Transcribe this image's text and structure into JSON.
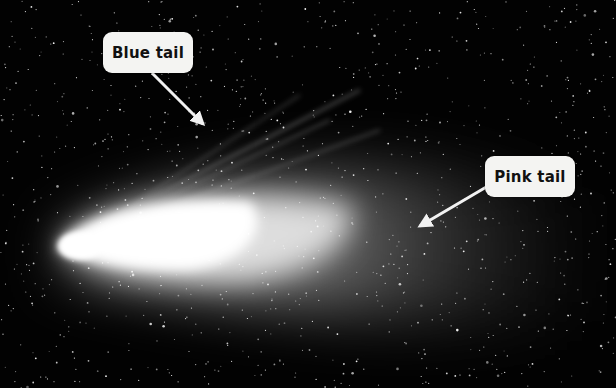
{
  "image": {
    "description": "Comet with bright nucleus on the left and two tails extending to the upper right",
    "background_color": "#020202",
    "coma_color": "#ffffff"
  },
  "labels": [
    {
      "text": "Blue tail",
      "box": {
        "x": 103,
        "y": 32,
        "w": 90,
        "h": 41
      },
      "arrow": {
        "x1": 152,
        "y1": 73,
        "x2": 203,
        "y2": 124
      }
    },
    {
      "text": "Pink tail",
      "box": {
        "x": 485,
        "y": 156,
        "w": 90,
        "h": 41
      },
      "arrow": {
        "x1": 488,
        "y1": 186,
        "x2": 420,
        "y2": 226
      }
    }
  ]
}
